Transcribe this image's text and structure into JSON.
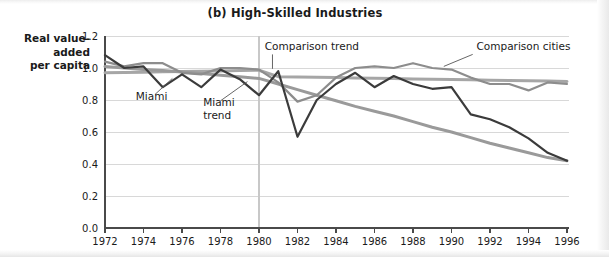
{
  "figure": {
    "title": "(b) High-Skilled Industries",
    "y_axis_label": "Real value-\nadded\nper capita",
    "y_axis_label_lines": [
      "Real value-",
      "added",
      "per capita"
    ]
  },
  "annotations": [
    {
      "name": "miami-label",
      "text": "Miami",
      "x": 1973.6,
      "y": 0.8
    },
    {
      "name": "miami-trend-label",
      "text": "Miami",
      "text2": "trend",
      "x": 1977.1,
      "y": 0.765
    },
    {
      "name": "comparison-trend-label",
      "text": "Comparison trend",
      "x": 1980.3,
      "y": 1.115
    },
    {
      "name": "comparison-cities-label",
      "text": "Comparison cities",
      "x": 1991.3,
      "y": 1.115
    }
  ],
  "colors": {
    "miami_series": "#3b3b3b",
    "comparison_cities_series": "#8d8d8d",
    "miami_trend": "#9a9a9a",
    "comparison_trend": "#a6a6a6",
    "axis": "#4a4a4a",
    "gridline": "#d8d8d8",
    "reference_line": "#c8c8c8",
    "text": "#1a1a1a",
    "background": "#ffffff"
  },
  "chart_data": {
    "type": "line",
    "title": "(b) High-Skilled Industries",
    "xlabel": "",
    "ylabel": "Real value-added per capita",
    "xlim": [
      1972,
      1996
    ],
    "ylim": [
      0.0,
      1.2
    ],
    "ytick_values": [
      0.0,
      0.2,
      0.4,
      0.6,
      0.8,
      1.0,
      1.2
    ],
    "ytick_labels": [
      "0.0",
      "0.2",
      "0.4",
      "0.6",
      "0.8",
      "1.0",
      "1.2"
    ],
    "xtick_values": [
      1972,
      1974,
      1976,
      1978,
      1980,
      1982,
      1984,
      1986,
      1988,
      1990,
      1992,
      1994,
      1996
    ],
    "xtick_labels": [
      "1972",
      "1974",
      "1976",
      "1978",
      "1980",
      "1982",
      "1984",
      "1986",
      "1988",
      "1990",
      "1992",
      "1994",
      "1996"
    ],
    "grid": "horizontal",
    "legend_position": "inline-annotations",
    "reference_lines": [
      {
        "name": "mariel-boatlift-1980",
        "orientation": "vertical",
        "x": 1980
      }
    ],
    "x": [
      1972,
      1973,
      1974,
      1975,
      1976,
      1977,
      1978,
      1979,
      1980,
      1981,
      1982,
      1983,
      1984,
      1985,
      1986,
      1987,
      1988,
      1989,
      1990,
      1991,
      1992,
      1993,
      1994,
      1995,
      1996
    ],
    "series": [
      {
        "name": "Miami",
        "color": "#3b3b3b",
        "values": [
          1.08,
          1.0,
          1.01,
          0.88,
          0.96,
          0.88,
          0.99,
          0.93,
          0.83,
          0.98,
          0.57,
          0.8,
          0.9,
          0.97,
          0.88,
          0.95,
          0.9,
          0.87,
          0.88,
          0.71,
          0.68,
          0.63,
          0.56,
          0.47,
          0.42
        ]
      },
      {
        "name": "Comparison cities",
        "color": "#8d8d8d",
        "values": [
          1.04,
          1.01,
          1.03,
          1.03,
          0.97,
          0.96,
          1.0,
          1.0,
          0.99,
          0.91,
          0.79,
          0.83,
          0.94,
          1.0,
          1.01,
          1.0,
          1.03,
          1.0,
          0.99,
          0.94,
          0.9,
          0.9,
          0.86,
          0.91,
          0.9
        ]
      },
      {
        "name": "Miami trend",
        "type": "trend",
        "color": "#9a9a9a",
        "values": [
          1.01,
          1.0,
          0.99,
          0.985,
          0.975,
          0.965,
          0.955,
          0.945,
          0.935,
          0.9,
          0.865,
          0.83,
          0.795,
          0.76,
          0.73,
          0.7,
          0.665,
          0.63,
          0.6,
          0.565,
          0.53,
          0.5,
          0.47,
          0.44,
          0.42
        ]
      },
      {
        "name": "Comparison trend",
        "type": "trend",
        "color": "#a6a6a6",
        "values": [
          0.97,
          0.972,
          0.974,
          0.976,
          0.978,
          0.98,
          0.982,
          0.984,
          0.986,
          0.946,
          0.944,
          0.942,
          0.94,
          0.938,
          0.936,
          0.934,
          0.932,
          0.93,
          0.928,
          0.926,
          0.924,
          0.922,
          0.92,
          0.918,
          0.916
        ]
      }
    ]
  }
}
